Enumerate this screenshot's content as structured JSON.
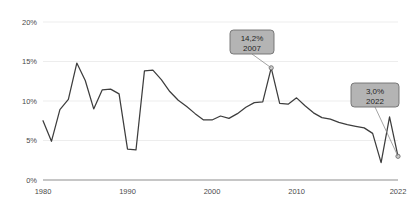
{
  "chart_data": {
    "type": "line",
    "title": "",
    "subtitle": "",
    "xlabel": "",
    "ylabel": "",
    "grid": true,
    "legend": "none",
    "xlim": [
      1980,
      2022
    ],
    "ylim": [
      0,
      20
    ],
    "y_tick_labels": [
      "20%",
      "15%",
      "10%",
      "5%",
      "0%"
    ],
    "y_tick_values": [
      20,
      15,
      10,
      5,
      0
    ],
    "x_tick_labels": [
      "1980",
      "1990",
      "2000",
      "2010",
      "2022"
    ],
    "x_tick_values": [
      1980,
      1990,
      2000,
      2010,
      2022
    ],
    "x": [
      1980,
      1981,
      1982,
      1983,
      1984,
      1985,
      1986,
      1987,
      1988,
      1989,
      1990,
      1991,
      1992,
      1993,
      1994,
      1995,
      1996,
      1997,
      1998,
      1999,
      2000,
      2001,
      2002,
      2003,
      2004,
      2005,
      2006,
      2007,
      2008,
      2009,
      2010,
      2011,
      2012,
      2013,
      2014,
      2015,
      2016,
      2017,
      2018,
      2019,
      2020,
      2021,
      2022
    ],
    "values": [
      7.5,
      4.9,
      8.9,
      10.2,
      14.8,
      12.6,
      9.0,
      11.4,
      11.5,
      10.9,
      3.9,
      3.8,
      13.8,
      13.9,
      12.7,
      11.2,
      10.1,
      9.3,
      8.4,
      7.6,
      7.6,
      8.1,
      7.8,
      8.4,
      9.2,
      9.8,
      9.9,
      14.2,
      9.7,
      9.6,
      10.4,
      9.4,
      8.5,
      7.9,
      7.7,
      7.3,
      7.0,
      6.8,
      6.6,
      5.9,
      2.2,
      8.0,
      3.0
    ],
    "series_color": "#3d3d3d",
    "annotations": [
      {
        "name": "peak-2007",
        "value_label": "14,2%",
        "year_label": "2007",
        "x": 2007,
        "y": 14.2
      },
      {
        "name": "endpoint-2022",
        "value_label": "3,0%",
        "year_label": "2022",
        "x": 2022,
        "y": 3.0
      }
    ]
  },
  "colors": {
    "background": "#ffffff",
    "grid": "#e9e9e9",
    "axis": "#8d8d8d",
    "line": "#3d3d3d",
    "callout_fill": "#b4b4b4",
    "callout_border": "#6e6e6e",
    "callout_text": "#262626",
    "tick_text": "#4a4a4a"
  }
}
